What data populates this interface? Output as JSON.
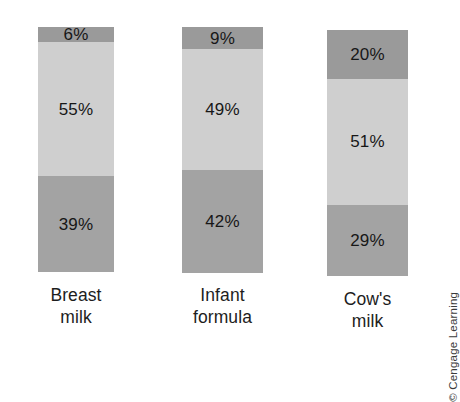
{
  "chart_data": {
    "type": "bar",
    "subtype": "stacked-100",
    "title": "",
    "subtitle": "",
    "xlabel": "",
    "ylabel": "",
    "ylim": [
      0,
      100
    ],
    "grid": false,
    "legend_position": "none",
    "orientation": "vertical",
    "value_suffix": "%",
    "categories": [
      "Breast milk",
      "Infant formula",
      "Cow's milk"
    ],
    "category_lines": [
      [
        "Breast",
        "milk"
      ],
      [
        "Infant",
        "formula"
      ],
      [
        "Cow's",
        "milk"
      ]
    ],
    "series": [
      {
        "name": "top",
        "values": [
          6,
          9,
          20
        ],
        "color": "#9a9a9a"
      },
      {
        "name": "middle",
        "values": [
          55,
          49,
          51
        ],
        "color": "#cfcfcf"
      },
      {
        "name": "bottom",
        "values": [
          39,
          42,
          29
        ],
        "color": "#a3a3a3"
      }
    ],
    "bars": [
      {
        "category": "Breast milk",
        "segments": [
          {
            "label": "6%",
            "value": 6,
            "color": "#9a9a9a"
          },
          {
            "label": "55%",
            "value": 55,
            "color": "#cfcfcf"
          },
          {
            "label": "39%",
            "value": 39,
            "color": "#a3a3a3"
          }
        ]
      },
      {
        "category": "Infant formula",
        "segments": [
          {
            "label": "9%",
            "value": 9,
            "color": "#9a9a9a"
          },
          {
            "label": "49%",
            "value": 49,
            "color": "#cfcfcf"
          },
          {
            "label": "42%",
            "value": 42,
            "color": "#a3a3a3"
          }
        ]
      },
      {
        "category": "Cow's milk",
        "segments": [
          {
            "label": "20%",
            "value": 20,
            "color": "#9a9a9a"
          },
          {
            "label": "51%",
            "value": 51,
            "color": "#cfcfcf"
          },
          {
            "label": "29%",
            "value": 29,
            "color": "#a3a3a3"
          }
        ]
      }
    ],
    "annotations": [
      "© Cengage Learning"
    ]
  },
  "credit": {
    "text": "© Cengage Learning"
  },
  "colors": {
    "segment_top": "#9a9a9a",
    "segment_middle": "#cfcfcf",
    "segment_bottom": "#a3a3a3",
    "background": "#ffffff",
    "text": "#171717"
  }
}
